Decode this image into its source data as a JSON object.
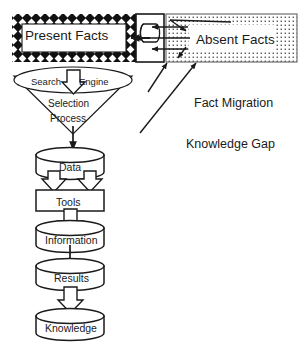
{
  "diagram": {
    "type": "flowchart",
    "background_color": "#ffffff",
    "line_color": "#1a1a1a",
    "nodes": {
      "present_facts": {
        "label": "Present Facts",
        "shape": "rectangle-with-checkered-border",
        "fill": "#ffffff",
        "border_pattern": "black-with-white-diamonds"
      },
      "absent_facts": {
        "label": "Absent Facts",
        "shape": "rectangle",
        "fill": "#ffffff",
        "border_pattern": "fine-dotted-stipple"
      },
      "knowledge_gap_zone": {
        "label": "",
        "shape": "narrow-rectangle-with-cylinder",
        "fill": "#ffffff"
      },
      "funnel": {
        "shape": "funnel",
        "ellipse_label_left": "Search",
        "ellipse_label_right": "Engine",
        "body_label_line1": "Selection",
        "body_label_line2": "Process"
      },
      "data": {
        "label": "Data",
        "shape": "cylinder"
      },
      "tools": {
        "label": "Tools",
        "shape": "rectangle"
      },
      "information": {
        "label": "Information",
        "shape": "cylinder"
      },
      "results": {
        "label": "Results",
        "shape": "cylinder"
      },
      "knowledge": {
        "label": "Knowledge",
        "shape": "cylinder"
      }
    },
    "annotations": [
      {
        "name": "fact-migration",
        "label": "Fact Migration"
      },
      {
        "name": "knowledge-gap",
        "label": "Knowledge Gap"
      }
    ],
    "arrows": {
      "migration_arrows_count": 3,
      "migration_direction": "right-to-left",
      "funnel_block_arrow": "down",
      "data_to_tools_block_arrows": 2,
      "tools_to_information_block_arrows": 1,
      "information_to_results_line_arrows": 1,
      "results_to_knowledge_block_arrows": 1
    }
  }
}
